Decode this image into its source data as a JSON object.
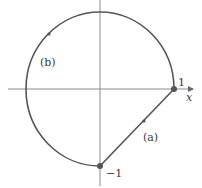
{
  "diagram": {
    "type": "contour-plot",
    "axes": {
      "x_label": "x",
      "origin_px": [
        100,
        89
      ]
    },
    "circle": {
      "center_px": [
        100,
        89
      ],
      "radius_px": 74
    },
    "points": [
      {
        "label": "1",
        "px": [
          174,
          89
        ],
        "meaning": "z = 1"
      },
      {
        "label": "−1",
        "px": [
          100,
          166
        ],
        "meaning": "z = -i"
      }
    ],
    "paths": [
      {
        "label": "(a)",
        "kind": "straight segment",
        "from": "−1",
        "to": "1"
      },
      {
        "label": "(b)",
        "kind": "circular arc (270°)",
        "from": "1",
        "to": "−1"
      }
    ],
    "labels": {
      "x_axis": "x",
      "point_one": "1",
      "point_minus_one": "−1",
      "path_a": "(a)",
      "path_b": "(b)"
    },
    "colors": {
      "curve": "#555555",
      "axis": "#8a8a8a",
      "text": "#3a3a3a",
      "point": "#555555"
    }
  }
}
